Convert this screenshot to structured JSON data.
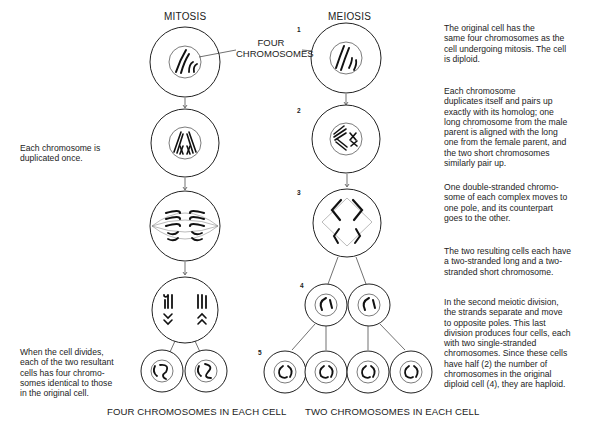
{
  "titles": {
    "mitosis": "MITOSIS",
    "meiosis": "MEIOSIS"
  },
  "callout": {
    "line1": "FOUR",
    "line2": "CHROMOSOMES"
  },
  "steps": [
    "1",
    "2",
    "3",
    "4",
    "5"
  ],
  "mitosis_notes": {
    "duplicated": "Each chromosome is\nduplicated once.",
    "divides": "When the cell divides,\neach of the two resultant\ncells has four chromo-\nsomes identical to those\nin the original cell."
  },
  "meiosis_notes": [
    "The original cell has the\nsame four chromosomes as the\ncell undergoing mitosis. The cell\nis diploid.",
    "Each chromosome\nduplicates itself and pairs up\nexactly with its homolog; one\nlong chromosome from the male\nparent is aligned with the long\none from the female parent, and\nthe two short chromosomes\nsimilarly pair up.",
    "One double-stranded chromo-\nsome of each complex moves to\none pole, and its counterpart\ngoes to the other.",
    "The two resulting cells each have\na two-stranded long and a two-\nstranded short chromosome.",
    "In the second meiotic division,\nthe strands separate and move\nto opposite poles. This last\ndivision produces four cells, each\nwith two single-stranded\nchromosomes. Since these cells\nhave half (2) the number of\nchromosomes in the original\ndiploid cell (4), they are haploid."
  ],
  "footers": {
    "mitosis": "FOUR CHROMOSOMES IN EACH CELL",
    "meiosis": "TWO CHROMOSOMES IN EACH CELL"
  },
  "stage_names": {
    "mitosis": [
      "original-cell",
      "duplicated-chromosomes",
      "metaphase",
      "dividing-cell",
      "daughter-cells"
    ],
    "meiosis": [
      "original-cell",
      "paired-homologs",
      "first-division",
      "two-cells",
      "four-haploid-cells"
    ]
  }
}
